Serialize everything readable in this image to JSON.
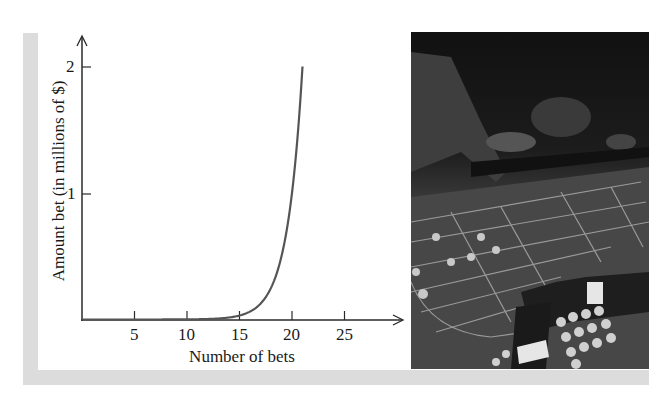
{
  "chart_data": {
    "type": "line",
    "title": "",
    "xlabel": "Number of bets",
    "ylabel": "Amount bet (in millions of $)",
    "x_ticks": [
      5,
      10,
      15,
      20,
      25
    ],
    "y_ticks": [
      1,
      2
    ],
    "xlim": [
      0,
      30
    ],
    "ylim": [
      0,
      2.3
    ],
    "grid": false,
    "legend": null,
    "series": [
      {
        "name": "Amount bet",
        "color": "#555555",
        "x": [
          0,
          2,
          4,
          6,
          8,
          10,
          12,
          13,
          14,
          15,
          16,
          17,
          18,
          19,
          20,
          20.5,
          21
        ],
        "values": [
          1e-06,
          4e-06,
          1.6e-05,
          6.4e-05,
          0.000256,
          0.001,
          0.004,
          0.008,
          0.016,
          0.033,
          0.066,
          0.131,
          0.262,
          0.524,
          1.049,
          1.483,
          2.0
        ]
      }
    ]
  },
  "labels": {
    "xlabel": "Number of bets",
    "ylabel": "Amount bet (in millions of $)",
    "x_ticks": [
      "5",
      "10",
      "15",
      "20",
      "25"
    ],
    "y_ticks": [
      "1",
      "2"
    ]
  },
  "photo": {
    "description": "black-and-white photograph of a casino roulette table with players placing chips"
  },
  "colors": {
    "frame": "#dcdcdc",
    "axis": "#2a2a2a",
    "curve": "#555555"
  }
}
